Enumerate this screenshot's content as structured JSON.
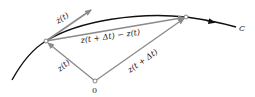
{
  "diagram": {
    "curve_label": "C",
    "origin_label": "0",
    "vectors": {
      "tangent": "ż(t)",
      "z_t": "z(t)",
      "z_t_dt": "z(t + Δt)",
      "difference": "z(t + Δt) − z(t)"
    },
    "colors": {
      "curve": "#111111",
      "vector": "#8a8a8a",
      "text": "#222222"
    }
  }
}
